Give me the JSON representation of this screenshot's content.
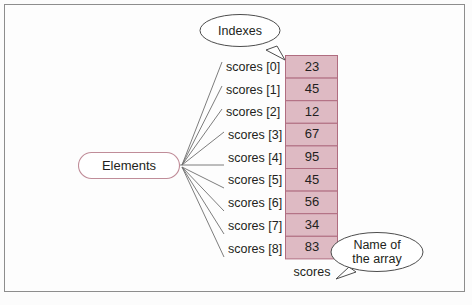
{
  "figure": {
    "background_color": "#fdfdfd",
    "frame_color": "#8d8d8d",
    "cell_fill_color": "#debac3",
    "cell_border_color": "#b06d80",
    "line_color": "#6e6e6e",
    "text_color": "#231f20"
  },
  "callouts": {
    "indexes": {
      "label": "Indexes"
    },
    "name_of_array": {
      "line1": "Name of",
      "line2": "the array"
    }
  },
  "elements_box": {
    "label": "Elements"
  },
  "array": {
    "name": "scores",
    "indexes": [
      "scores [0]",
      "scores [1]",
      "scores [2]",
      "scores [3]",
      "scores [4]",
      "scores [5]",
      "scores [6]",
      "scores [7]",
      "scores [8]"
    ],
    "values": [
      "23",
      "45",
      "12",
      "67",
      "95",
      "45",
      "56",
      "34",
      "83"
    ]
  }
}
